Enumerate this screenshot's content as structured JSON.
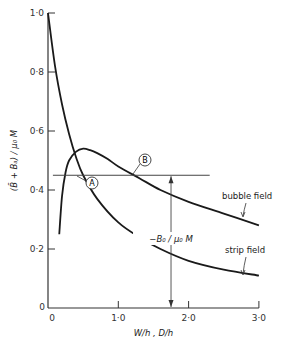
{
  "chart_data": {
    "type": "line",
    "title": "",
    "xlabel": "W/h , D/h",
    "ylabel": "(B̄ + B_a) / μ₀M",
    "xlim": [
      0,
      3.0
    ],
    "ylim": [
      0,
      1.0
    ],
    "x_ticks": [
      "0",
      "1·0",
      "2·0",
      "3·0"
    ],
    "y_ticks": [
      "0",
      "0·2",
      "0·4",
      "0·6",
      "0·8",
      "1·0"
    ],
    "grid": false,
    "series": [
      {
        "name": "strip field",
        "x": [
          0.0,
          0.1,
          0.2,
          0.3,
          0.4,
          0.5,
          0.7,
          1.0,
          1.3,
          1.6,
          2.0,
          2.5,
          3.0
        ],
        "y": [
          1.0,
          0.82,
          0.69,
          0.59,
          0.51,
          0.45,
          0.37,
          0.29,
          0.24,
          0.2,
          0.16,
          0.13,
          0.11
        ]
      },
      {
        "name": "bubble field",
        "x": [
          0.16,
          0.2,
          0.25,
          0.3,
          0.4,
          0.5,
          0.6,
          0.7,
          0.85,
          1.0,
          1.3,
          1.6,
          2.0,
          2.5,
          3.0
        ],
        "y": [
          0.25,
          0.38,
          0.46,
          0.5,
          0.53,
          0.54,
          0.535,
          0.525,
          0.505,
          0.48,
          0.44,
          0.4,
          0.36,
          0.32,
          0.28
        ]
      }
    ],
    "reference_line": {
      "y": 0.45,
      "x_start": 0.07,
      "x_end": 2.3
    },
    "arrow": {
      "x": 1.75,
      "y_from": 0.0,
      "y_to": 0.45,
      "label": "-B₀/μ₀M"
    },
    "annotations": [
      {
        "label": "A",
        "x": 0.6,
        "y": 0.42
      },
      {
        "label": "B",
        "x": 1.25,
        "y": 0.5
      },
      {
        "label": "bubble field",
        "x": 2.5,
        "y": 0.42
      },
      {
        "label": "strip field",
        "x": 2.5,
        "y": 0.2
      }
    ]
  },
  "labels": {
    "ylabel_text": "(B̄ + Bₐ) / μ₀ M",
    "xlabel_text": "W/h ,  D/h",
    "arrow_label": "−B₀ / μ₀ M",
    "bubble": "bubble field",
    "strip": "strip field",
    "A": "A",
    "B": "B",
    "origin_y": "0",
    "origin_x": "0"
  }
}
